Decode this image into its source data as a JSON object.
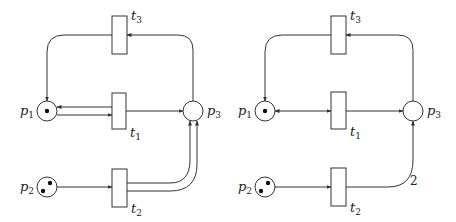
{
  "nets": [
    {
      "id": "left",
      "places": [
        {
          "id": "p1",
          "label": "p",
          "sub": "1",
          "tokens": 1
        },
        {
          "id": "p2",
          "label": "p",
          "sub": "2",
          "tokens": 2
        },
        {
          "id": "p3",
          "label": "p",
          "sub": "3",
          "tokens": 0
        }
      ],
      "transitions": [
        {
          "id": "t1",
          "label": "t",
          "sub": "1"
        },
        {
          "id": "t2",
          "label": "t",
          "sub": "2"
        },
        {
          "id": "t3",
          "label": "t",
          "sub": "3"
        }
      ],
      "arcs": [
        {
          "from": "p1",
          "to": "t1",
          "weight": 1
        },
        {
          "from": "t1",
          "to": "p1",
          "weight": 1
        },
        {
          "from": "t1",
          "to": "p3",
          "weight": 1
        },
        {
          "from": "p2",
          "to": "t2",
          "weight": 1
        },
        {
          "from": "t2",
          "to": "p3",
          "weight": 1,
          "parallel": 2
        },
        {
          "from": "p3",
          "to": "t3",
          "weight": 1
        },
        {
          "from": "t3",
          "to": "p1",
          "weight": 1
        }
      ]
    },
    {
      "id": "right",
      "places": [
        {
          "id": "p1",
          "label": "p",
          "sub": "1",
          "tokens": 1
        },
        {
          "id": "p2",
          "label": "p",
          "sub": "2",
          "tokens": 2
        },
        {
          "id": "p3",
          "label": "p",
          "sub": "3",
          "tokens": 0
        }
      ],
      "transitions": [
        {
          "id": "t1",
          "label": "t",
          "sub": "1"
        },
        {
          "id": "t2",
          "label": "t",
          "sub": "2"
        },
        {
          "id": "t3",
          "label": "t",
          "sub": "3"
        }
      ],
      "arcs": [
        {
          "from": "p1",
          "to": "t1",
          "weight": 1,
          "bidirectional": true
        },
        {
          "from": "t1",
          "to": "p3",
          "weight": 1
        },
        {
          "from": "p2",
          "to": "t2",
          "weight": 1
        },
        {
          "from": "t2",
          "to": "p3",
          "weight": 2,
          "weight_label": "2"
        },
        {
          "from": "p3",
          "to": "t3",
          "weight": 1
        },
        {
          "from": "t3",
          "to": "p1",
          "weight": 1
        }
      ]
    }
  ]
}
